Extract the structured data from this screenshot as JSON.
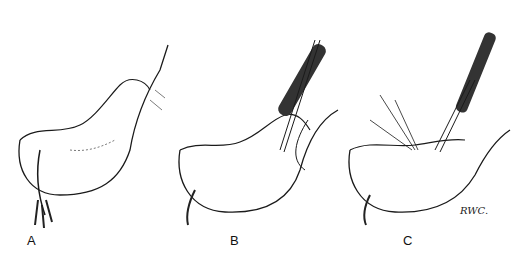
{
  "figure": {
    "panels": [
      {
        "label": "A",
        "content": "stomach with pylorus, unmodified"
      },
      {
        "label": "B",
        "content": "stomach with instrument and forceps inserted along greater curvature"
      },
      {
        "label": "C",
        "content": "stomach with stapler/instrument and retraction sutures"
      }
    ],
    "signature": "RWC.",
    "colors": {
      "ink": "#1a1a1a",
      "instrument": "#333333",
      "background": "#ffffff"
    }
  }
}
